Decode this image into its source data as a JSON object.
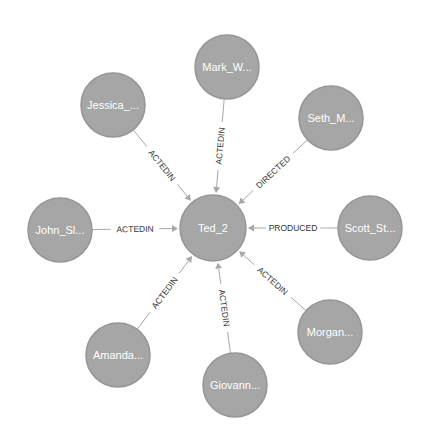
{
  "graph": {
    "center": {
      "id": "ted",
      "label": "Ted_2",
      "x": 213,
      "y": 228,
      "r": 33
    },
    "node_color": "#a6a6a6",
    "edge_color": "#a8a8a8",
    "nodes": [
      {
        "id": "mark",
        "label": "Mark_W...",
        "x": 227,
        "y": 67,
        "r": 32,
        "rel": "ACTEDIN"
      },
      {
        "id": "seth",
        "label": "Seth_M...",
        "x": 331,
        "y": 118,
        "r": 32,
        "rel": "DIRECTED"
      },
      {
        "id": "scott",
        "label": "Scott_St...",
        "x": 370,
        "y": 228,
        "r": 32,
        "rel": "PRODUCED"
      },
      {
        "id": "morgan",
        "label": "Morgan...",
        "x": 330,
        "y": 332,
        "r": 32,
        "rel": "ACTEDIN"
      },
      {
        "id": "giovann",
        "label": "Giovann...",
        "x": 235,
        "y": 385,
        "r": 32,
        "rel": "ACTEDIN"
      },
      {
        "id": "amanda",
        "label": "Amanda...",
        "x": 118,
        "y": 355,
        "r": 32,
        "rel": "ACTEDIN"
      },
      {
        "id": "john",
        "label": "John_Sl...",
        "x": 60,
        "y": 230,
        "r": 32,
        "rel": "ACTEDIN"
      },
      {
        "id": "jessica",
        "label": "Jessica_...",
        "x": 113,
        "y": 105,
        "r": 32,
        "rel": "ACTEDIN"
      }
    ]
  }
}
